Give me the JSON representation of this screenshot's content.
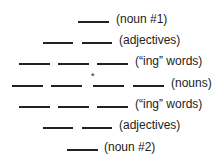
{
  "poem": {
    "rows": [
      {
        "label": "(noun #1)",
        "blanks": 1
      },
      {
        "label": "(adjectives)",
        "blanks": 2
      },
      {
        "label": "(“ing” words)",
        "blanks": 3
      },
      {
        "label": "(nouns)",
        "blanks": 4,
        "marker": "*"
      },
      {
        "label": "(“ing” words)",
        "blanks": 3
      },
      {
        "label": "(adjectives)",
        "blanks": 2
      },
      {
        "label": "(noun #2)",
        "blanks": 1
      }
    ]
  }
}
